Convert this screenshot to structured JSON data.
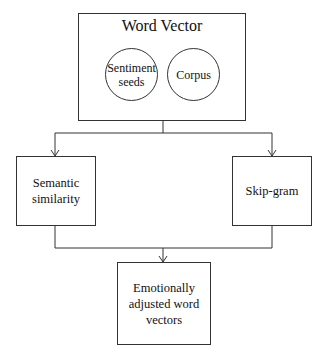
{
  "diagram": {
    "top_box": {
      "title": "Word Vector",
      "circles": [
        {
          "label": "Sentiment seeds"
        },
        {
          "label": "Corpus"
        }
      ]
    },
    "left_box": {
      "label": "Semantic similarity"
    },
    "right_box": {
      "label": "Skip-gram"
    },
    "bottom_box": {
      "label": "Emotionally adjusted word vectors"
    },
    "edges": [
      {
        "from": "Word Vector",
        "to": "Semantic similarity"
      },
      {
        "from": "Word Vector",
        "to": "Skip-gram"
      },
      {
        "from": "Semantic similarity",
        "to": "Emotionally adjusted word vectors"
      },
      {
        "from": "Skip-gram",
        "to": "Emotionally adjusted word vectors"
      }
    ],
    "colors": {
      "stroke": "#333333",
      "background": "#ffffff",
      "text": "#111111"
    }
  }
}
